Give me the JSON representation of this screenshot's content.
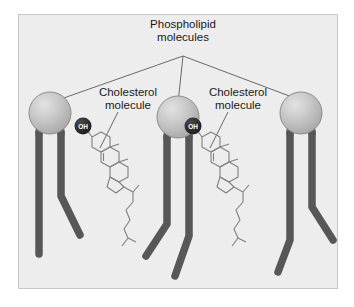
{
  "figure": {
    "background_color": "#ffffff",
    "panel_color": "#ededed",
    "panel_border_color": "#c8c8c8"
  },
  "labels": {
    "phospholipid": "Phospholipid\nmolecules",
    "cholesterol_left": "Cholesterol\nmolecule",
    "cholesterol_right": "Cholesterol\nmolecule"
  },
  "annotations": {
    "hydroxyl_group_left": "OH",
    "hydroxyl_group_right": "OH"
  },
  "colors": {
    "head_fill": "#b9b9b9",
    "head_highlight": "#dedede",
    "head_stroke": "#8a8a8a",
    "tail_color": "#575757",
    "oh_circle": "#2b2b2b",
    "oh_label": "#ffffff",
    "leader_line": "#5a5a5a",
    "ring_stroke": "#808080",
    "text": "#1a1a1a"
  },
  "structure": {
    "phospholipid_count": 3,
    "cholesterol_count": 2,
    "leader_line_count": 3,
    "phospholipid_parts": [
      "head-sphere",
      "tail-straight",
      "tail-kinked"
    ],
    "cholesterol_parts": [
      "hydroxyl-badge",
      "steroid-ring-A",
      "steroid-ring-B",
      "steroid-ring-C",
      "steroid-ring-D",
      "methyl-groups",
      "alkyl-tail"
    ]
  }
}
